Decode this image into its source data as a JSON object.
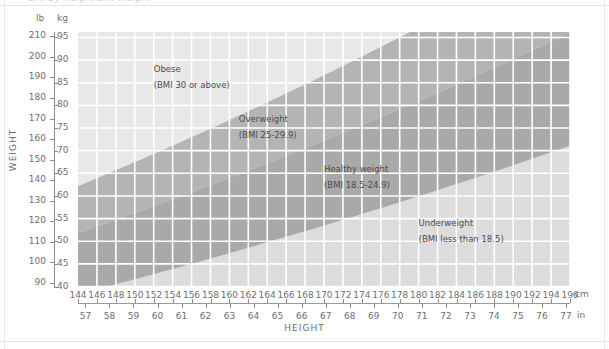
{
  "page": {
    "clipped_header": "BMI by Height and Weight",
    "axis_title_y": "WEIGHT",
    "axis_title_x": "HEIGHT",
    "unit_weight_primary": "lb",
    "unit_weight_secondary": "kg",
    "unit_height_primary": "cm",
    "unit_height_secondary": "in"
  },
  "colors": {
    "obese": "#e8e8e8",
    "overweight": "#b4b4b4",
    "healthy": "#a9a9a9",
    "underweight": "#dcdcdc",
    "gridline": "#ffffff",
    "axis": "#8a8a8a",
    "text": "#6d6e71"
  },
  "chart_data": {
    "type": "area",
    "title": "BMI by Height and Weight",
    "xlabel": "HEIGHT",
    "ylabel": "WEIGHT",
    "x_axis": {
      "primary_unit": "cm",
      "primary_ticks": [
        144,
        146,
        148,
        150,
        152,
        154,
        156,
        158,
        160,
        162,
        164,
        166,
        168,
        170,
        172,
        174,
        176,
        178,
        180,
        182,
        184,
        186,
        188,
        190,
        192,
        194,
        196
      ],
      "primary_range": [
        144,
        196
      ],
      "secondary_unit": "in",
      "secondary_ticks": [
        57,
        58,
        59,
        60,
        61,
        62,
        63,
        64,
        65,
        66,
        67,
        68,
        69,
        70,
        71,
        72,
        73,
        74,
        75,
        76,
        77
      ],
      "secondary_range": [
        56.7,
        77.2
      ]
    },
    "y_axis": {
      "primary_unit": "lb",
      "primary_ticks": [
        90,
        100,
        110,
        120,
        130,
        140,
        150,
        160,
        170,
        180,
        190,
        200,
        210
      ],
      "primary_range": [
        88,
        212
      ],
      "secondary_unit": "kg",
      "secondary_ticks": [
        40,
        45,
        50,
        55,
        60,
        65,
        70,
        75,
        80,
        85,
        90,
        95
      ],
      "secondary_range": [
        39.9,
        96.2
      ]
    },
    "grid": true,
    "legend": "inline-annotations",
    "bands": [
      {
        "name": "Obese",
        "label": "Obese",
        "sublabel": "(BMI 30 or above)",
        "bmi_min": 30,
        "bmi_max": null,
        "color": "#e8e8e8",
        "label_x_cm": 152,
        "label_y_kg": 88
      },
      {
        "name": "Overweight",
        "label": "Overweight",
        "sublabel": "(BMI 25-29.9)",
        "bmi_min": 25,
        "bmi_max": 29.9,
        "color": "#b4b4b4",
        "label_x_cm": 161,
        "label_y_kg": 77
      },
      {
        "name": "Healthy weight",
        "label": "Healthy weight",
        "sublabel": "(BMI 18.5-24.9)",
        "bmi_min": 18.5,
        "bmi_max": 24.9,
        "color": "#a9a9a9",
        "label_x_cm": 170,
        "label_y_kg": 66
      },
      {
        "name": "Underweight",
        "label": "Underweight",
        "sublabel": "(BMI less than 18.5)",
        "bmi_min": null,
        "bmi_max": 18.5,
        "color": "#dcdcdc",
        "label_x_cm": 180,
        "label_y_kg": 54
      }
    ],
    "boundary_curves": [
      {
        "bmi": 30,
        "points_cm_kg": [
          [
            144,
            62.2
          ],
          [
            160,
            76.8
          ],
          [
            176,
            92.9
          ],
          [
            180,
            97.2
          ],
          [
            196,
            115.2
          ]
        ]
      },
      {
        "bmi": 25,
        "points_cm_kg": [
          [
            144,
            51.8
          ],
          [
            160,
            64.0
          ],
          [
            176,
            77.4
          ],
          [
            180,
            81.0
          ],
          [
            196,
            96.0
          ]
        ]
      },
      {
        "bmi": 18.5,
        "points_cm_kg": [
          [
            144,
            38.4
          ],
          [
            160,
            47.4
          ],
          [
            176,
            57.3
          ],
          [
            180,
            59.9
          ],
          [
            196,
            71.1
          ]
        ]
      }
    ]
  }
}
